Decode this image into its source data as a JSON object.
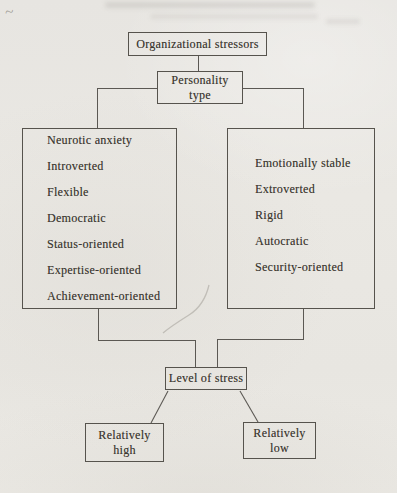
{
  "colors": {
    "paper": "#e9e7e2",
    "ink": "#3c3831",
    "line": "#5b5853"
  },
  "artifacts": {
    "tilde": "~"
  },
  "diagram": {
    "organizational_stressors": {
      "label": "Organizational stressors"
    },
    "personality_type": {
      "line1": "Personality",
      "line2": "type"
    },
    "left_traits": {
      "items": [
        "Neurotic anxiety",
        "Introverted",
        "Flexible",
        "Democratic",
        "Status-oriented",
        "Expertise-oriented",
        "Achievement-oriented"
      ]
    },
    "right_traits": {
      "items": [
        "Emotionally stable",
        "Extroverted",
        "Rigid",
        "Autocratic",
        "Security-oriented"
      ]
    },
    "level_of_stress": {
      "label": "Level of stress"
    },
    "outcome_high": {
      "line1": "Relatively",
      "line2": "high"
    },
    "outcome_low": {
      "line1": "Relatively",
      "line2": "low"
    }
  }
}
